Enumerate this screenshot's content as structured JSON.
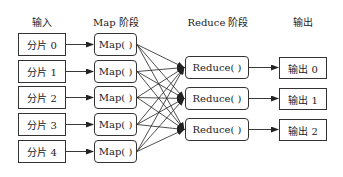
{
  "headers": {
    "input": "输入",
    "map": "Map 阶段",
    "reduce": "Reduce 阶段",
    "output": "输出"
  },
  "inputs": [
    "分片 0",
    "分片 1",
    "分片 2",
    "分片 3",
    "分片 4"
  ],
  "maps": [
    "Map( )",
    "Map( )",
    "Map( )",
    "Map( )",
    "Map( )"
  ],
  "reduces": [
    "Reduce( )",
    "Reduce( )",
    "Reduce( )"
  ],
  "outputs": [
    "输出 0",
    "输出 1",
    "输出 2"
  ],
  "colors": {
    "line": "#222222",
    "border": "#333333"
  }
}
